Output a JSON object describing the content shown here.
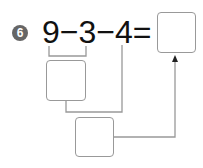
{
  "problem": {
    "number": "6",
    "expression": "9−3−4=",
    "terms": [
      "9",
      "3",
      "4"
    ],
    "operators": [
      "−",
      "−",
      "="
    ]
  },
  "answer_boxes": {
    "final_answer": "",
    "step1_result": "",
    "step2_result": ""
  },
  "colors": {
    "badge": "#666666",
    "lines": "#999999",
    "text": "#111111"
  }
}
